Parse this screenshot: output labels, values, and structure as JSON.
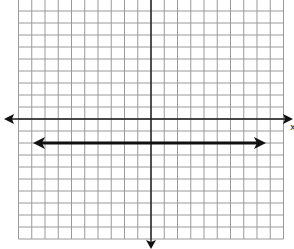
{
  "chart_data": {
    "type": "line",
    "title": "",
    "xlabel": "x",
    "ylabel": "",
    "xlim": [
      -10,
      10
    ],
    "ylim": [
      -10,
      10
    ],
    "grid": true,
    "grid_step": 1,
    "axes_arrows": {
      "x": "both",
      "y": "down-visible"
    },
    "series": [
      {
        "name": "y = -2",
        "equation": "y = -2",
        "kind": "horizontal line with arrows at both ends",
        "x": [
          -9,
          9
        ],
        "y": [
          -2,
          -2
        ]
      }
    ]
  },
  "layout": {
    "origin_px": [
      151,
      119
    ],
    "cell_w_px": 13.25,
    "cell_h_px": 12,
    "grid_left_px": 18.5,
    "grid_right_px": 283.5,
    "grid_top_px": -1,
    "grid_bottom_px": 239
  },
  "labels": {
    "x_axis": "x"
  }
}
